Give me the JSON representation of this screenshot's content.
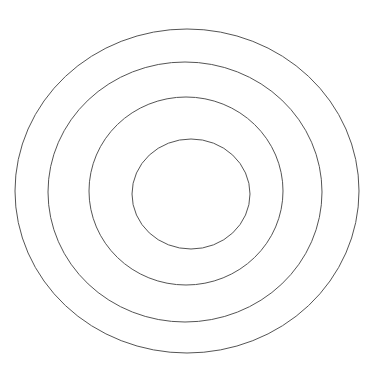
{
  "figure": {
    "kind": "concentric-circles-diagram",
    "title": "",
    "background_color": "#ffffff",
    "stroke_color": "#555555",
    "stroke_width": 1,
    "fill": "none",
    "canvas": {
      "width": 384,
      "height": 383
    },
    "ring_count": 4,
    "rings": [
      {
        "name": "ring-outer",
        "index": 4,
        "label": "",
        "cx": 187,
        "cy": 191,
        "rx": 172,
        "ry": 162,
        "stroke": "#555555",
        "stroke_width": 1,
        "fill": "none",
        "bounds": {
          "left": 15,
          "right": 359,
          "top": 29,
          "bottom": 353
        }
      },
      {
        "name": "ring-third",
        "index": 3,
        "label": "",
        "cx": 185,
        "cy": 192,
        "rx": 137,
        "ry": 130,
        "stroke": "#555555",
        "stroke_width": 1,
        "fill": "none",
        "bounds": {
          "left": 48,
          "right": 322,
          "top": 62,
          "bottom": 323
        }
      },
      {
        "name": "ring-second",
        "index": 2,
        "label": "",
        "cx": 186,
        "cy": 191,
        "rx": 97,
        "ry": 94,
        "stroke": "#555555",
        "stroke_width": 1,
        "fill": "none",
        "bounds": {
          "left": 89,
          "right": 283,
          "top": 97,
          "bottom": 285
        }
      },
      {
        "name": "ring-inner",
        "index": 1,
        "label": "",
        "cx": 191,
        "cy": 194,
        "rx": 59,
        "ry": 55,
        "stroke": "#555555",
        "stroke_width": 1,
        "fill": "none",
        "bounds": {
          "left": 132,
          "right": 250,
          "top": 139,
          "bottom": 250
        }
      }
    ]
  }
}
